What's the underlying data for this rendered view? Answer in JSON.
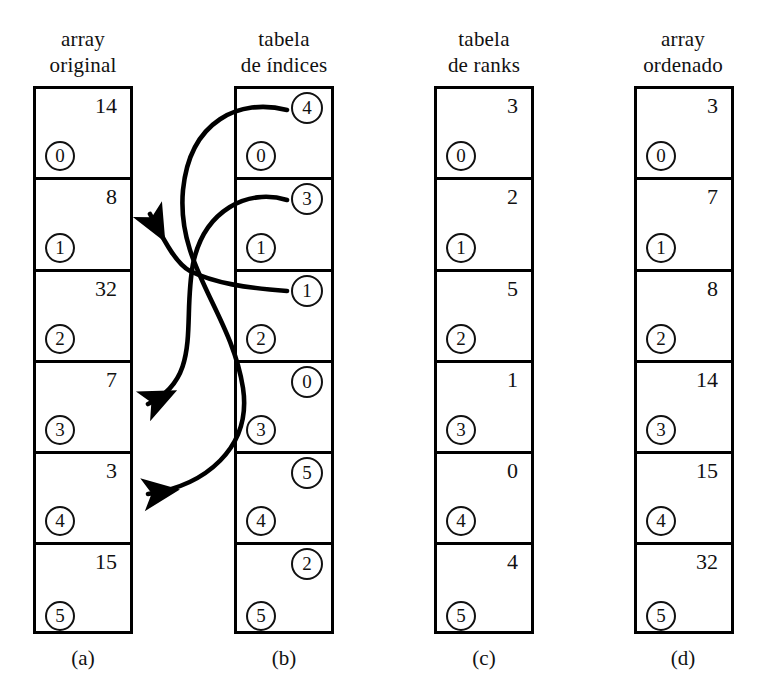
{
  "figure": {
    "columns": [
      {
        "id": "array-original",
        "header": "array\noriginal",
        "caption": "(a)",
        "value_style": "plain",
        "cells": [
          {
            "value": "14",
            "index": "0"
          },
          {
            "value": "8",
            "index": "1"
          },
          {
            "value": "32",
            "index": "2"
          },
          {
            "value": "7",
            "index": "3"
          },
          {
            "value": "3",
            "index": "4"
          },
          {
            "value": "15",
            "index": "5"
          }
        ]
      },
      {
        "id": "tabela-de-indices",
        "header": "tabela\nde índices",
        "caption": "(b)",
        "value_style": "circled",
        "cells": [
          {
            "value": "4",
            "index": "0"
          },
          {
            "value": "3",
            "index": "1"
          },
          {
            "value": "1",
            "index": "2"
          },
          {
            "value": "0",
            "index": "3"
          },
          {
            "value": "5",
            "index": "4"
          },
          {
            "value": "2",
            "index": "5"
          }
        ]
      },
      {
        "id": "tabela-de-ranks",
        "header": "tabela\nde ranks",
        "caption": "(c)",
        "value_style": "plain",
        "cells": [
          {
            "value": "3",
            "index": "0"
          },
          {
            "value": "2",
            "index": "1"
          },
          {
            "value": "5",
            "index": "2"
          },
          {
            "value": "1",
            "index": "3"
          },
          {
            "value": "0",
            "index": "4"
          },
          {
            "value": "4",
            "index": "5"
          }
        ]
      },
      {
        "id": "array-ordenado",
        "header": "array\nordenado",
        "caption": "(d)",
        "value_style": "plain",
        "cells": [
          {
            "value": "3",
            "index": "0"
          },
          {
            "value": "7",
            "index": "1"
          },
          {
            "value": "8",
            "index": "2"
          },
          {
            "value": "14",
            "index": "3"
          },
          {
            "value": "15",
            "index": "4"
          },
          {
            "value": "32",
            "index": "5"
          }
        ]
      }
    ],
    "arrows": [
      {
        "name": "arrow-index0-to-element4",
        "from_column": "tabela-de-indices",
        "from_row": 0,
        "to_column": "array-original",
        "to_row": 4
      },
      {
        "name": "arrow-index1-to-element3",
        "from_column": "tabela-de-indices",
        "from_row": 1,
        "to_column": "array-original",
        "to_row": 3
      },
      {
        "name": "arrow-index2-to-element1",
        "from_column": "tabela-de-indices",
        "from_row": 2,
        "to_column": "array-original",
        "to_row": 1
      }
    ],
    "colors": {
      "ink": "#000000",
      "paper": "#ffffff"
    }
  }
}
